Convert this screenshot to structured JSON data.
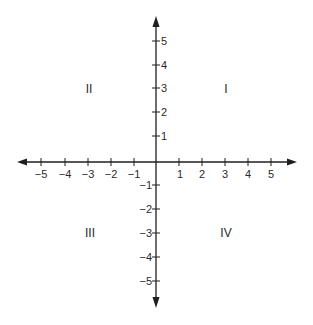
{
  "diagram": {
    "type": "coordinate-plane",
    "x_axis": {
      "min": -5,
      "max": 5,
      "tick_labels": [
        "−5",
        "−4",
        "−3",
        "−2",
        "−1",
        "1",
        "2",
        "3",
        "4",
        "5"
      ]
    },
    "y_axis": {
      "min": -5,
      "max": 5,
      "tick_labels_positive": [
        "5",
        "4",
        "3",
        "2",
        "1"
      ],
      "tick_labels_negative": [
        "−1",
        "−2",
        "−3",
        "−4",
        "−5"
      ]
    },
    "quadrants": {
      "q1": "I",
      "q2": "II",
      "q3": "III",
      "q4": "IV"
    },
    "colors": {
      "axis": "#1f1f1f",
      "text": "#2a2a2a",
      "background": "#ffffff"
    }
  }
}
